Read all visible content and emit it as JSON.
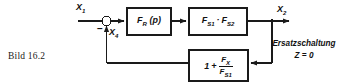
{
  "figure": {
    "caption": "Bild 16.2",
    "note_line1": "Ersatzschaltung",
    "note_line2": "Z = 0"
  },
  "signals": {
    "input_base": "X",
    "input_sub": "1",
    "feedback_base": "X",
    "feedback_sub": "4",
    "output_base": "X",
    "output_sub": "2",
    "minus_sign": "–"
  },
  "blocks": [
    {
      "id": "controller",
      "base": "F",
      "sub": "R",
      "suffix": " (p)",
      "label": "F_R (p)"
    },
    {
      "id": "plant",
      "factor1_base": "F",
      "factor1_sub": "S1",
      "dot": "·",
      "factor2_base": "F",
      "factor2_sub": "S2",
      "label": "F_S1 · F_S2"
    },
    {
      "id": "feedback",
      "one": "1",
      "plus": "+",
      "num_base": "F",
      "num_sub": "X",
      "den_base": "F",
      "den_sub": "S1",
      "label": "1 + F_X / F_S1"
    }
  ],
  "colors": {
    "line": "#1a1a1a",
    "text": "#111111",
    "background": "#ffffff"
  }
}
